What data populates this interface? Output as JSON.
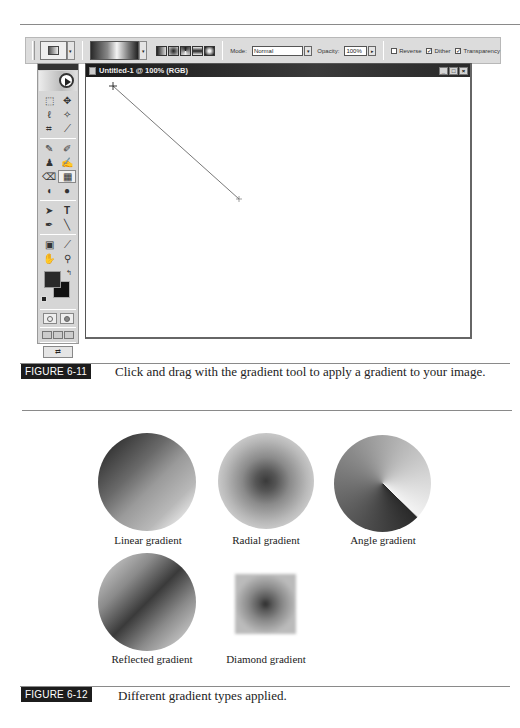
{
  "figure_11": {
    "label": "FIGURE 6-11",
    "caption": "Click and drag with the gradient tool to apply a gradient to your image."
  },
  "options_bar": {
    "mode_label": "Mode:",
    "mode_value": "Normal",
    "opacity_label": "Opacity:",
    "opacity_value": "100%",
    "reverse_label": "Reverse",
    "reverse_checked": false,
    "dither_label": "Dither",
    "dither_checked": true,
    "transparency_label": "Transparency",
    "transparency_checked": true,
    "gradient_types": [
      "linear",
      "radial",
      "angle",
      "reflected",
      "diamond"
    ],
    "dropdown_arrow": "▾",
    "stepper_arrow": "▸"
  },
  "toolbox": {
    "tools": [
      {
        "name": "marquee-tool",
        "glyph": "⬚"
      },
      {
        "name": "move-tool",
        "glyph": "✥"
      },
      {
        "name": "lasso-tool",
        "glyph": "ℓ"
      },
      {
        "name": "magic-wand-tool",
        "glyph": "✧"
      },
      {
        "name": "crop-tool",
        "glyph": "⌗"
      },
      {
        "name": "slice-tool",
        "glyph": "⟋"
      },
      {
        "name": "healing-brush-tool",
        "glyph": "✎"
      },
      {
        "name": "brush-tool",
        "glyph": "✐"
      },
      {
        "name": "clone-stamp-tool",
        "glyph": "♟"
      },
      {
        "name": "history-brush-tool",
        "glyph": "✍"
      },
      {
        "name": "eraser-tool",
        "glyph": "⌫"
      },
      {
        "name": "gradient-tool",
        "glyph": "▦"
      },
      {
        "name": "blur-tool",
        "glyph": "◖"
      },
      {
        "name": "dodge-tool",
        "glyph": "●"
      },
      {
        "name": "path-selection-tool",
        "glyph": "➤"
      },
      {
        "name": "type-tool",
        "glyph": "T"
      },
      {
        "name": "pen-tool",
        "glyph": "✒"
      },
      {
        "name": "line-tool",
        "glyph": "╲"
      },
      {
        "name": "notes-tool",
        "glyph": "▣"
      },
      {
        "name": "eyedropper-tool",
        "glyph": "⟋"
      },
      {
        "name": "hand-tool",
        "glyph": "✋"
      },
      {
        "name": "zoom-tool",
        "glyph": "⚲"
      }
    ],
    "swap_glyph": "↰",
    "jump_glyph": "⇄"
  },
  "document": {
    "title": "Untitled-1 @ 100% (RGB)",
    "minimize": "_",
    "maximize": "□",
    "close": "×",
    "drag_line": {
      "x1": 27,
      "y1": 9,
      "x2": 153,
      "y2": 122
    }
  },
  "figure_12": {
    "label": "FIGURE 6-12",
    "caption": "Different gradient types applied."
  },
  "samples": [
    {
      "label": "Linear gradient"
    },
    {
      "label": "Radial gradient"
    },
    {
      "label": "Angle gradient"
    },
    {
      "label": "Reflected gradient"
    },
    {
      "label": "Diamond gradient"
    }
  ]
}
